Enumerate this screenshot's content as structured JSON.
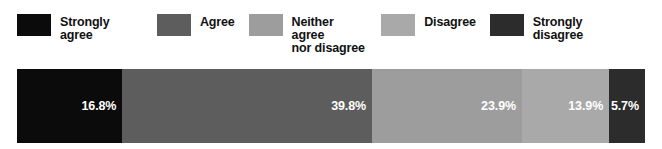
{
  "chart_data": {
    "type": "bar",
    "orientation": "horizontal",
    "stacked": true,
    "title": "",
    "subtitle": "",
    "xlabel": "",
    "ylabel": "",
    "xlim": [
      0,
      100
    ],
    "grid": false,
    "legend_position": "top",
    "categories": [
      ""
    ],
    "units": "percent",
    "series": [
      {
        "name": "Strongly agree",
        "values": [
          16.8
        ],
        "label": "16.8%",
        "color": "#0b0b0b"
      },
      {
        "name": "Agree",
        "values": [
          39.8
        ],
        "label": "39.8%",
        "color": "#5d5d5d"
      },
      {
        "name": "Neither agree nor disagree",
        "values": [
          23.9
        ],
        "label": "23.9%",
        "color": "#9d9d9d"
      },
      {
        "name": "Disagree",
        "values": [
          13.9
        ],
        "label": "13.9%",
        "color": "#a9a9a9"
      },
      {
        "name": "Strongly disagree",
        "values": [
          5.7
        ],
        "label": "5.7%",
        "color": "#2c2c2c"
      }
    ]
  },
  "legend": {
    "items": [
      {
        "label": "Strongly agree",
        "color": "#0b0b0b",
        "swatch_name": "legend-swatch-strongly-agree"
      },
      {
        "label": "Agree",
        "color": "#5d5d5d",
        "swatch_name": "legend-swatch-agree"
      },
      {
        "label": "Neither agree\nnor disagree",
        "color": "#9d9d9d",
        "swatch_name": "legend-swatch-neither"
      },
      {
        "label": "Disagree",
        "color": "#a9a9a9",
        "swatch_name": "legend-swatch-disagree"
      },
      {
        "label": "Strongly disagree",
        "color": "#2c2c2c",
        "swatch_name": "legend-swatch-strongly-disagree"
      }
    ]
  },
  "bar": {
    "segments": [
      {
        "label": "16.8%",
        "value": 16.8,
        "color": "#0b0b0b",
        "text_color": "#ffffff",
        "name": "bar-segment-strongly-agree"
      },
      {
        "label": "39.8%",
        "value": 39.8,
        "color": "#5d5d5d",
        "text_color": "#ffffff",
        "name": "bar-segment-agree"
      },
      {
        "label": "23.9%",
        "value": 23.9,
        "color": "#9d9d9d",
        "text_color": "#ffffff",
        "name": "bar-segment-neither"
      },
      {
        "label": "13.9%",
        "value": 13.9,
        "color": "#a9a9a9",
        "text_color": "#ffffff",
        "name": "bar-segment-disagree"
      },
      {
        "label": "5.7%",
        "value": 5.7,
        "color": "#2c2c2c",
        "text_color": "#ffffff",
        "name": "bar-segment-strongly-disagree"
      }
    ]
  },
  "background_color": "#ffffff"
}
